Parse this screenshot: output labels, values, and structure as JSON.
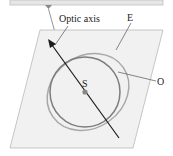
{
  "diagram": {
    "labels": {
      "optic_axis": "Optic axis",
      "extraordinary": "E",
      "ordinary": "O",
      "source": "S"
    },
    "colors": {
      "plane_fill": "#f1f1f1",
      "plane_stroke": "#b9b9b9",
      "top_bar_fill": "#e6e6e6",
      "pointer": "#8a8a8a",
      "circle_o": "#7d7d7d",
      "ellipse_e": "#a8a8a8",
      "axis_arrow": "#1a1a1a",
      "source_dot": "#888888"
    }
  }
}
